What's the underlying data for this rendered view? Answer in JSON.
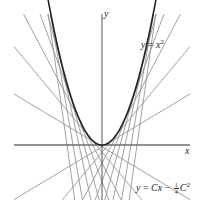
{
  "diagram": {
    "axes": {
      "x_label": "x",
      "y_label": "y"
    },
    "curve": {
      "equation_prefix": "y = ",
      "equation_var": "x",
      "equation_exp": "2",
      "color": "#222222"
    },
    "tangent_family": {
      "equation_prefix": "y = ",
      "equation_C": "C",
      "equation_x": "x",
      "equation_minus": " − ",
      "frac_num": "1",
      "frac_den": "4",
      "equation_C2": "C",
      "equation_exp": "2",
      "color": "#8a8a8a"
    },
    "tangent_params_px": [
      -70,
      -58,
      -46,
      -36,
      -27,
      -19,
      -12,
      -6,
      0,
      6,
      12,
      19,
      27,
      36,
      46,
      58,
      70
    ]
  }
}
